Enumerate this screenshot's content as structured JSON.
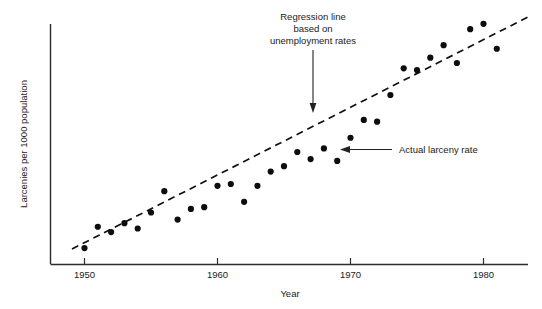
{
  "figure": {
    "background": "#ffffff",
    "ink_color": "#111111"
  },
  "chart_data": {
    "type": "scatter",
    "title": "",
    "xlabel": "Year",
    "ylabel": "Larcenies per 1000 population",
    "xlim": [
      1949,
      1982
    ],
    "ylim": [
      0,
      10
    ],
    "grid": false,
    "legend": "none",
    "x_ticks": [
      1950,
      1960,
      1970,
      1980
    ],
    "x_tick_labels": [
      "1950",
      "1960",
      "1970",
      "1980"
    ],
    "y_ticks": [],
    "y_tick_labels": [],
    "series": [
      {
        "name": "Actual larceny rate",
        "type": "scatter",
        "marker": "filled-circle",
        "x": [
          1950,
          1951,
          1952,
          1953,
          1954,
          1955,
          1956,
          1957,
          1958,
          1959,
          1960,
          1961,
          1962,
          1963,
          1964,
          1965,
          1966,
          1967,
          1968,
          1969,
          1970,
          1971,
          1972,
          1973,
          1974,
          1975,
          1976,
          1977,
          1978,
          1979,
          1980,
          1981
        ],
        "y": [
          0.25,
          0.85,
          0.7,
          0.95,
          0.8,
          1.25,
          1.85,
          1.05,
          1.35,
          1.4,
          2.0,
          2.05,
          1.55,
          2.0,
          2.4,
          2.55,
          2.95,
          2.75,
          3.05,
          2.7,
          3.35,
          3.85,
          3.8,
          4.55,
          5.3,
          5.25,
          5.6,
          5.95,
          5.45,
          6.4,
          6.55,
          5.85
        ]
      },
      {
        "name": "Regression line based on unemployment rates",
        "type": "line",
        "style": "dashed",
        "x": [
          1949.1,
          1981.4
        ],
        "y": [
          0.15,
          7.0
        ]
      }
    ],
    "annotations": [
      {
        "name": "regression-line-annotation",
        "lines": [
          "Regression line",
          "based on",
          "unemployment rates"
        ],
        "target_x": 1966.2,
        "target_y": 3.55
      },
      {
        "name": "actual-larceny-rate-annotation",
        "lines": [
          "Actual larceny rate"
        ],
        "target_x": 1968.0,
        "target_y": 3.05
      }
    ]
  }
}
